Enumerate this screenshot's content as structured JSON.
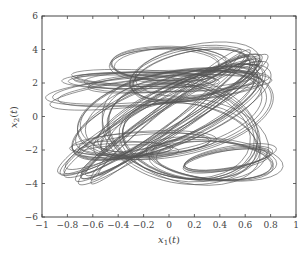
{
  "chart_data": {
    "type": "line",
    "title": "",
    "xlabel": "x1(t)",
    "ylabel": "x2(t)",
    "xlim": [
      -1,
      1
    ],
    "ylim": [
      -6,
      6
    ],
    "grid": false,
    "legend": null,
    "x_ticks": [
      -1,
      -0.8,
      -0.6,
      -0.4,
      -0.2,
      0,
      0.2,
      0.4,
      0.6,
      0.8,
      1
    ],
    "x_tick_labels": [
      "−1",
      "−0.8",
      "−0.6",
      "−0.4",
      "−0.2",
      "0",
      "0.2",
      "0.4",
      "0.6",
      "0.8",
      "1"
    ],
    "y_ticks": [
      -6,
      -4,
      -2,
      0,
      2,
      4,
      6
    ],
    "y_tick_labels": [
      "−6",
      "−4",
      "−2",
      "0",
      "2",
      "4",
      "6"
    ],
    "series": [
      {
        "name": "trajectory",
        "color": "#555555",
        "approx_extent": {
          "x_min": -0.92,
          "x_max": 0.95,
          "y_min": -4.6,
          "y_max": 4.3
        },
        "orbits": [
          {
            "cx": 0.05,
            "cy": 0.3,
            "rx": 0.75,
            "ry": 2.4,
            "rot": -12
          },
          {
            "cx": -0.05,
            "cy": 0.2,
            "rx": 0.8,
            "ry": 1.9,
            "rot": -20
          },
          {
            "cx": 0.1,
            "cy": 0.4,
            "rx": 0.7,
            "ry": 1.6,
            "rot": -25
          },
          {
            "cx": -0.1,
            "cy": 1.6,
            "rx": 0.82,
            "ry": 0.8,
            "rot": -5
          },
          {
            "cx": 0.05,
            "cy": 2.0,
            "rx": 0.7,
            "ry": 0.6,
            "rot": -3
          },
          {
            "cx": -0.2,
            "cy": 2.2,
            "rx": 0.6,
            "ry": 0.5,
            "rot": 0
          },
          {
            "cx": -0.3,
            "cy": 2.3,
            "rx": 0.45,
            "ry": 0.35,
            "rot": 0
          },
          {
            "cx": 0.2,
            "cy": 2.6,
            "rx": 0.5,
            "ry": 1.5,
            "rot": -10
          },
          {
            "cx": 0.0,
            "cy": 3.2,
            "rx": 0.45,
            "ry": 1.0,
            "rot": 0
          },
          {
            "cx": -0.05,
            "cy": 0.0,
            "rx": 0.9,
            "ry": 1.0,
            "rot": -30
          },
          {
            "cx": 0.0,
            "cy": -0.2,
            "rx": 0.85,
            "ry": 0.8,
            "rot": -35
          },
          {
            "cx": 0.0,
            "cy": 0.1,
            "rx": 0.8,
            "ry": 0.6,
            "rot": -38
          },
          {
            "cx": -0.2,
            "cy": -1.6,
            "rx": 0.55,
            "ry": 0.7,
            "rot": -5
          },
          {
            "cx": -0.35,
            "cy": -2.0,
            "rx": 0.4,
            "ry": 0.45,
            "rot": 0
          },
          {
            "cx": 0.2,
            "cy": -1.5,
            "rx": 0.55,
            "ry": 2.3,
            "rot": 10
          },
          {
            "cx": 0.35,
            "cy": -2.6,
            "rx": 0.5,
            "ry": 1.2,
            "rot": 5
          },
          {
            "cx": 0.45,
            "cy": -2.5,
            "rx": 0.35,
            "ry": 0.6,
            "rot": -10
          },
          {
            "cx": 0.1,
            "cy": -0.8,
            "rx": 0.6,
            "ry": 2.9,
            "rot": 12
          }
        ]
      }
    ]
  }
}
